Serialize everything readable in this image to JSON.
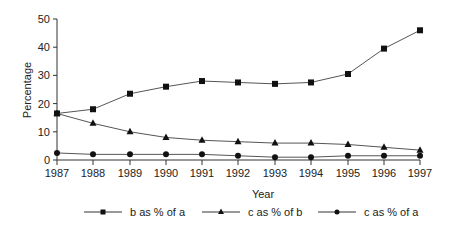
{
  "chart_data": {
    "type": "line",
    "title": "",
    "xlabel": "Year",
    "ylabel": "Percentage",
    "ylim": [
      0,
      50
    ],
    "yticks": [
      0,
      10,
      20,
      30,
      40,
      50
    ],
    "grid": false,
    "legend_position": "bottom",
    "categories": [
      "1987",
      "1988",
      "1989",
      "1990",
      "1991",
      "1992",
      "1993",
      "1994",
      "1995",
      "1996",
      "1997"
    ],
    "series": [
      {
        "name": "b as % of a",
        "marker": "square",
        "values": [
          16.5,
          18,
          23.5,
          26,
          28,
          27.5,
          27,
          27.5,
          30.5,
          39.5,
          46
        ]
      },
      {
        "name": "c as % of b",
        "marker": "triangle",
        "values": [
          16.5,
          13,
          10,
          8,
          7,
          6.5,
          6,
          6,
          5.5,
          4.5,
          3.5
        ]
      },
      {
        "name": "c as % of a",
        "marker": "circle",
        "values": [
          2.5,
          2,
          2,
          2,
          2,
          1.5,
          1,
          1,
          1.5,
          1.5,
          1.5
        ]
      }
    ]
  }
}
